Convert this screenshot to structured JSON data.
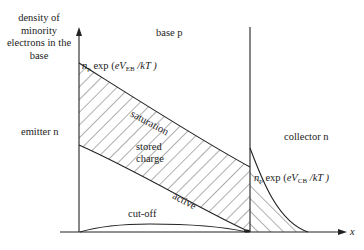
{
  "diagram": {
    "y_axis_label": "density of minority electrons in the base",
    "x_axis_label": "x",
    "regions": {
      "emitter": "emitter n",
      "base": "base p",
      "collector": "collector n"
    },
    "annotations": {
      "emitter_edge": {
        "n": "n",
        "n_sub": "p",
        "exp": " exp (",
        "eV": "eV",
        "V_sub": "EB",
        "rest": " /kT )"
      },
      "collector_edge": {
        "n": "n",
        "n_sub": "p",
        "exp": " exp (",
        "eV": "eV",
        "V_sub": "CB",
        "rest": " /kT )"
      },
      "saturation": "saturation",
      "stored_charge_1": "stored",
      "stored_charge_2": "charge",
      "active": "active",
      "cut_off": "cut-off"
    },
    "colors": {
      "line": "#222222",
      "background": "#ffffff"
    }
  }
}
